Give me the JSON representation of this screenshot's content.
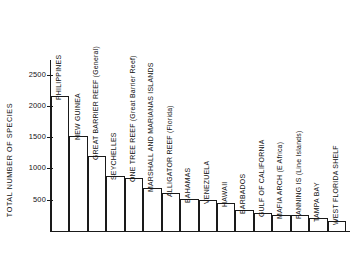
{
  "chart_data": {
    "type": "bar",
    "title": "",
    "xlabel": "",
    "ylabel": "TOTAL NUMBER OF SPECIES",
    "ylim": [
      0,
      2700
    ],
    "grid": false,
    "legend": "none",
    "yticks": [
      500,
      1000,
      1500,
      2000,
      2500
    ],
    "ytick_labels": [
      "500",
      "1000",
      "1500",
      "2000",
      "2500"
    ],
    "categories": [
      "PHILIPPINES",
      "NEW GUINEA",
      "GREAT BARRIER REEF  (General)",
      "SEYCHELLES",
      "ONE TREE REEF  (Great Barrier Reef)",
      "MARSHALL AND MARIANAS ISLANDS",
      "ALLIGATOR REEF  (Florida)",
      "BAHAMAS",
      "VENEZUELA",
      "HAWAII",
      "BARBADOS",
      "GULF OF CALIFORNIA",
      "MAFIA ARCH (E Africa)",
      "FANNING IS (Line Islands)",
      "TAMPA BAY",
      "WEST FLORIDA SHELF"
    ],
    "values": [
      2150,
      1520,
      1200,
      880,
      850,
      680,
      600,
      510,
      490,
      450,
      330,
      280,
      260,
      255,
      210,
      160
    ]
  },
  "axis": {
    "y_title": "TOTAL NUMBER OF SPECIES"
  }
}
